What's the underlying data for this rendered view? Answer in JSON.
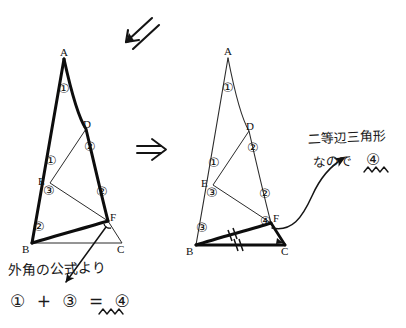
{
  "page": {
    "background_color": "#ffffff",
    "ink_color": "#111111",
    "width": 406,
    "height": 328
  },
  "arrows": {
    "top_double_arrow": {
      "name": "double-arrow-down-left",
      "glyph": "swarrow",
      "direction": "down-left"
    },
    "middle_implies": {
      "name": "implies-arrow",
      "glyph": "⇒",
      "direction": "right"
    },
    "pointer_to_F_left": {
      "name": "annotation-arrow-to-angle-F",
      "direction": "up-right"
    },
    "curved_to_note": {
      "name": "curved-annotation-arrow",
      "direction": "up-right"
    }
  },
  "left_figure": {
    "name": "triangle-figure-step1",
    "vertex_labels": [
      "A",
      "D",
      "E",
      "B",
      "F",
      "C"
    ],
    "angle_marks": [
      {
        "label": "1",
        "at": "A"
      },
      {
        "label": "2",
        "at": "D"
      },
      {
        "label": "1",
        "at": "E-upper"
      },
      {
        "label": "3",
        "at": "E-lower"
      },
      {
        "label": "2",
        "at": "F-inner"
      },
      {
        "label": "2",
        "at": "B"
      },
      {
        "label": "4",
        "at": "F-exterior"
      }
    ],
    "bold_path": "A-B-F-A"
  },
  "right_figure": {
    "name": "triangle-figure-step2",
    "vertex_labels": [
      "A",
      "D",
      "E",
      "B",
      "F",
      "C"
    ],
    "angle_marks": [
      {
        "label": "1",
        "at": "A"
      },
      {
        "label": "2",
        "at": "D"
      },
      {
        "label": "1",
        "at": "E-upper"
      },
      {
        "label": "3",
        "at": "E-lower"
      },
      {
        "label": "2",
        "at": "F-inner"
      },
      {
        "label": "3",
        "at": "B"
      },
      {
        "label": "4",
        "at": "F-exterior"
      }
    ],
    "bold_path": "B-F-C-B",
    "tick_marks": [
      "BF",
      "BC"
    ]
  },
  "annotations": {
    "bottom_note": "外角の公式より",
    "bottom_equation": "① + ③ = ④",
    "right_note_line1": "二等辺三角形",
    "right_note_line2": "なので",
    "right_note_result": "④"
  },
  "circled_numbers": {
    "one": "①",
    "two": "②",
    "three": "③",
    "four": "④"
  }
}
